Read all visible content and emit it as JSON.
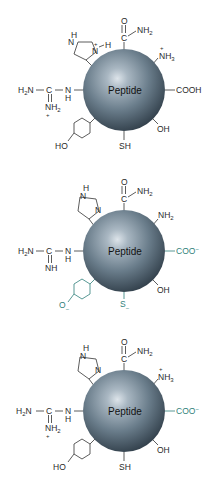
{
  "figure": {
    "colors": {
      "sphere_light": "#c9d3dc",
      "sphere_mid": "#6f8290",
      "sphere_dark": "#2e3b45",
      "label": "#2a2a2a",
      "charged_highlight": "#2f7f7a"
    },
    "panels": [
      {
        "core_label": "Peptide",
        "amide": {
          "o": "O",
          "c": "C",
          "nh2": "NH",
          "nh2_sub": "2"
        },
        "imidazole": {
          "n_top": "N",
          "h_top": "H",
          "n_bottom": "N",
          "plus": "+",
          "h_right": "H"
        },
        "amine": {
          "text": "NH",
          "sub": "3",
          "charge": "+"
        },
        "carboxyl": {
          "text": "COOH"
        },
        "hydroxyl": {
          "text": "OH"
        },
        "thiol": {
          "text": "SH"
        },
        "phenol": {
          "text": "HO"
        },
        "guanidino": {
          "h2n": "H",
          "h2n_sub": "2",
          "h2n_n": "N",
          "c": "C",
          "n": "N",
          "h": "H",
          "bottom": "NH",
          "bottom_sub": "2",
          "bottom_charge": "+"
        }
      },
      {
        "core_label": "Peptide",
        "amide": {
          "o": "O",
          "c": "C",
          "nh2": "NH",
          "nh2_sub": "2"
        },
        "imidazole": {
          "n_top": "N",
          "h_top": "H",
          "n_bottom": "N"
        },
        "amine": {
          "text": "NH",
          "sub": "2"
        },
        "carboxyl": {
          "text": "COO",
          "charge": "−"
        },
        "hydroxyl": {
          "text": "OH"
        },
        "thiol": {
          "text": "S",
          "charge": "−"
        },
        "phenol": {
          "text": "O",
          "charge": "−"
        },
        "guanidino": {
          "h2n": "H",
          "h2n_sub": "2",
          "h2n_n": "N",
          "c": "C",
          "n": "N",
          "h": "H",
          "bottom": "NH"
        }
      },
      {
        "core_label": "Peptide",
        "amide": {
          "o": "O",
          "c": "C",
          "nh2": "NH",
          "nh2_sub": "2"
        },
        "imidazole": {
          "n_top": "N",
          "h_top": "H",
          "n_bottom": "N"
        },
        "amine": {
          "text": "NH",
          "sub": "3",
          "charge": "+"
        },
        "carboxyl": {
          "text": "COO",
          "charge": "−"
        },
        "hydroxyl": {
          "text": "OH"
        },
        "thiol": {
          "text": "SH"
        },
        "phenol": {
          "text": "HO"
        },
        "guanidino": {
          "h2n": "H",
          "h2n_sub": "2",
          "h2n_n": "N",
          "c": "C",
          "n": "N",
          "h": "H",
          "bottom": "NH",
          "bottom_sub": "2",
          "bottom_charge": "+"
        }
      }
    ]
  }
}
